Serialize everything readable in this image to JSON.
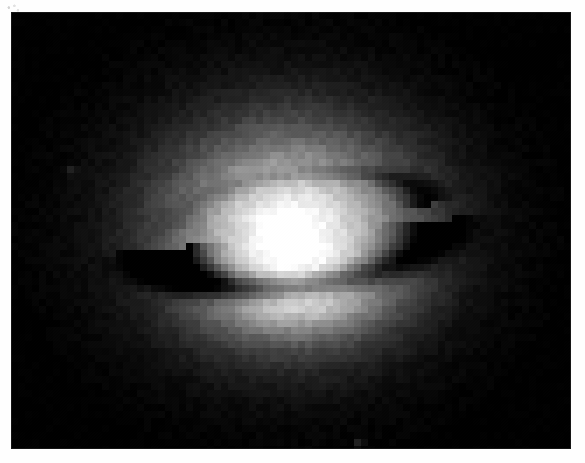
{
  "page": {
    "width": 585,
    "height": 463,
    "paper_color": "#fefefe",
    "caption": ""
  },
  "plate": {
    "label": "astronomical-grayscale-plate",
    "x": 11,
    "y": 12,
    "width": 560,
    "height": 437,
    "background_color": "#000000",
    "colormap": "grayscale",
    "rendering": "pixelated"
  },
  "chart_data": {
    "type": "heatmap",
    "title": "",
    "subtitle": "",
    "xlabel": "",
    "ylabel": "",
    "colormap": "gray",
    "grid": false,
    "legend": "none",
    "xlim": [
      0,
      80
    ],
    "ylim": [
      0,
      62
    ],
    "value_range": [
      0,
      255
    ],
    "pixel_block": 7,
    "background_value": 0,
    "noise_amplitude": 14,
    "components": [
      {
        "name": "outer-halo",
        "kind": "elliptical-gaussian",
        "cx": 290,
        "cy": 230,
        "rx": 205,
        "ry": 172,
        "peak_value": 150,
        "falloff": 2.1
      },
      {
        "name": "inner-bulge",
        "kind": "elliptical-gaussian",
        "cx": 292,
        "cy": 238,
        "rx": 140,
        "ry": 120,
        "peak_value": 120,
        "falloff": 2.0
      },
      {
        "name": "bright-south-band",
        "kind": "elliptical-gaussian",
        "cx": 300,
        "cy": 300,
        "rx": 118,
        "ry": 52,
        "peak_value": 70,
        "falloff": 2.0
      },
      {
        "name": "nucleus-point-source",
        "kind": "point-source",
        "cx": 287,
        "cy": 230,
        "radius": 8,
        "peak_value": 255
      },
      {
        "name": "dust-disk-dark-lane",
        "kind": "dark-ellipse-arc",
        "cx": 300,
        "cy": 240,
        "rx": 132,
        "ry": 46,
        "thickness": 24,
        "tilt_deg": -6,
        "depth": 172,
        "darkest_at": "west-southwest"
      },
      {
        "name": "dust-disk-far-rim",
        "kind": "dark-ellipse-arc",
        "cx": 300,
        "cy": 214,
        "rx": 124,
        "ry": 40,
        "thickness": 13,
        "tilt_deg": -6,
        "depth": 58,
        "darkest_at": "east-northeast"
      }
    ],
    "field_markers": [
      {
        "name": "faint-star-lower-right",
        "x": 360,
        "y": 440,
        "value": 30
      },
      {
        "name": "faint-star-left-field",
        "x": 68,
        "y": 170,
        "value": 22
      }
    ],
    "notes": "Elliptical galaxy bulge with a near-edge-on dark circumnuclear dust disk and an unresolved bright nucleus."
  }
}
